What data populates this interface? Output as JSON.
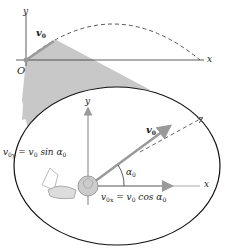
{
  "figure": {
    "top_diagram": {
      "axis_x_label": "x",
      "axis_y_label": "y",
      "origin_label": "O",
      "velocity_label": "v",
      "velocity_sub": "0",
      "trajectory_style": "dashed"
    },
    "inset": {
      "axis_x_label": "x",
      "axis_y_label": "y",
      "velocity_label": "v",
      "velocity_sub": "0",
      "angle_label": "α",
      "angle_sub": "0",
      "vy_component": {
        "lhs": "v",
        "lhs_sub": "0y",
        "rhs": "= v",
        "rhs_sub": "0",
        "fn": " sin α",
        "fn_sub": "0"
      },
      "vx_component": {
        "lhs": "v",
        "lhs_sub": "0x",
        "rhs": "= v",
        "rhs_sub": "0",
        "fn": " cos α",
        "fn_sub": "0"
      }
    },
    "colors": {
      "axis": "#333333",
      "wedge": "#c8c8c8",
      "arrow": "#9a9a9a",
      "ellipse": "#111111",
      "dashed": "#666666"
    }
  }
}
